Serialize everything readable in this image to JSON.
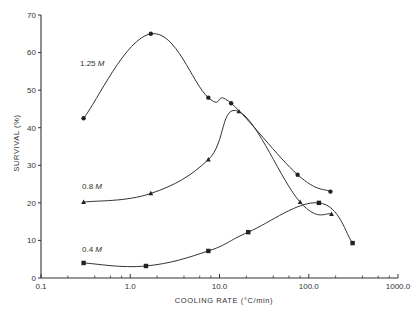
{
  "chart_data": {
    "type": "line",
    "title": "",
    "xlabel": "COOLING RATE (°C/min)",
    "ylabel": "SURVIVAL (%)",
    "xscale": "log",
    "xlim": [
      0.1,
      1000.0
    ],
    "ylim": [
      0,
      70
    ],
    "x_ticks": [
      "0.1",
      "1.0",
      "10.0",
      "100.0",
      "1000.0"
    ],
    "y_ticks": [
      "0",
      "10",
      "20",
      "30",
      "40",
      "50",
      "60",
      "70"
    ],
    "grid": false,
    "legend": "inline labels",
    "series": [
      {
        "name": "1.25 M",
        "marker": "circle",
        "points": [
          {
            "x": 0.3,
            "y": 42.5
          },
          {
            "x": 1.7,
            "y": 65
          },
          {
            "x": 7.5,
            "y": 48
          },
          {
            "x": 13.5,
            "y": 46.5
          },
          {
            "x": 75,
            "y": 27.5
          },
          {
            "x": 175,
            "y": 23
          }
        ]
      },
      {
        "name": "0.8 M",
        "marker": "triangle",
        "points": [
          {
            "x": 0.3,
            "y": 20.2
          },
          {
            "x": 1.7,
            "y": 22.5
          },
          {
            "x": 7.5,
            "y": 31.5
          },
          {
            "x": 16.5,
            "y": 44.3
          },
          {
            "x": 80,
            "y": 20.2
          },
          {
            "x": 180,
            "y": 17
          }
        ]
      },
      {
        "name": "0.4 M",
        "marker": "square",
        "points": [
          {
            "x": 0.3,
            "y": 4
          },
          {
            "x": 1.5,
            "y": 3.2
          },
          {
            "x": 7.5,
            "y": 7.2
          },
          {
            "x": 21,
            "y": 12.2
          },
          {
            "x": 130,
            "y": 20
          },
          {
            "x": 310,
            "y": 9.3
          }
        ]
      }
    ],
    "series_labels": [
      {
        "text": "1.25",
        "unit": "M",
        "x": 80,
        "y": 66
      },
      {
        "text": "0.8",
        "unit": "M",
        "x": 82,
        "y": 189
      },
      {
        "text": "0.4",
        "unit": "M",
        "x": 82,
        "y": 252
      }
    ]
  }
}
